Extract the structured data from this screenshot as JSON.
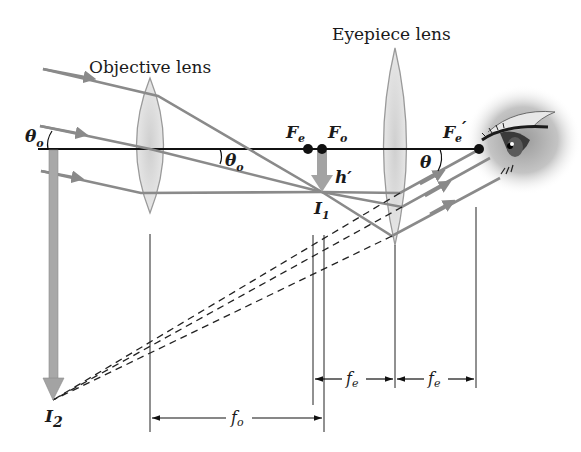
{
  "diagram": {
    "type": "ray diagram",
    "labels": {
      "objective_lens": "Objective lens",
      "eyepiece_lens": "Eyepiece lens"
    },
    "symbols": {
      "theta_o_incoming": {
        "main": "θ",
        "sub": "o"
      },
      "theta_o_at_lens": {
        "main": "θ",
        "sub": "o"
      },
      "theta_eye": {
        "main": "θ",
        "sub": ""
      },
      "focal_point_eyepiece": {
        "main": "F",
        "sub": "e"
      },
      "focal_point_objective": {
        "main": "F",
        "sub": "o"
      },
      "focal_point_eyepiece_prime": {
        "main": "F",
        "sub": "e",
        "prime": "′"
      },
      "image_height": {
        "main": "h′"
      },
      "first_image": {
        "main": "I",
        "sub": "1"
      },
      "final_image": {
        "main": "I",
        "sub": "2"
      }
    },
    "dimensions": {
      "fo": {
        "main": "f",
        "sub": "o"
      },
      "fe_left": {
        "main": "f",
        "sub": "e"
      },
      "fe_right": {
        "main": "f",
        "sub": "e"
      }
    },
    "colors": {
      "ray": "#8a8a8a",
      "axis": "#111111",
      "lens_fill": "#dcdcdc",
      "lens_stroke": "#9a9a9a",
      "image_arrow": "#a3a3a3",
      "dashed": "#222222"
    }
  }
}
